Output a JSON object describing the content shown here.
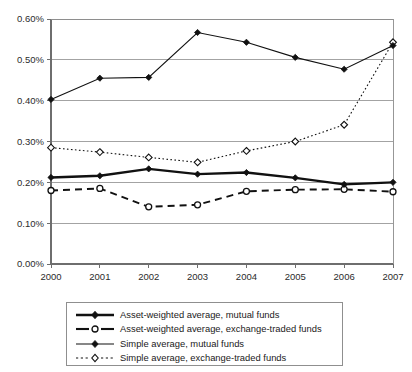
{
  "chart_data": {
    "type": "line",
    "title": "",
    "subtitle": "",
    "xlabel": "",
    "ylabel": "",
    "x": [
      "2000",
      "2001",
      "2002",
      "2003",
      "2004",
      "2005",
      "2006",
      "2007"
    ],
    "xtick_labels": [
      "2000",
      "2001",
      "2002",
      "2003",
      "2004",
      "2005",
      "2006",
      "2007"
    ],
    "ytick_labels": [
      "0.00%",
      "0.10%",
      "0.20%",
      "0.30%",
      "0.40%",
      "0.50%",
      "0.60%"
    ],
    "ytick_values": [
      0.0,
      0.1,
      0.2,
      0.3,
      0.4,
      0.5,
      0.6
    ],
    "ylim": [
      0.0,
      0.6
    ],
    "y_unit": "percent",
    "grid": "horizontal",
    "legend_position": "below",
    "series": [
      {
        "name": "Asset-weighted average, mutual funds",
        "line_style": "solid",
        "line_width": "thick",
        "marker": "filled-diamond",
        "color": "#111111",
        "values": [
          0.212,
          0.216,
          0.233,
          0.22,
          0.224,
          0.211,
          0.195,
          0.2
        ]
      },
      {
        "name": "Asset-weighted average, exchange-traded funds",
        "line_style": "dashed",
        "line_width": "medium",
        "marker": "open-circle",
        "color": "#111111",
        "values": [
          0.18,
          0.185,
          0.14,
          0.145,
          0.178,
          0.182,
          0.183,
          0.177
        ]
      },
      {
        "name": "Simple average, mutual funds",
        "line_style": "solid",
        "line_width": "thin",
        "marker": "filled-diamond",
        "color": "#111111",
        "values": [
          0.403,
          0.455,
          0.457,
          0.567,
          0.543,
          0.506,
          0.477,
          0.535
        ]
      },
      {
        "name": "Simple average, exchange-traded funds",
        "line_style": "dotted",
        "line_width": "thin",
        "marker": "open-diamond",
        "color": "#111111",
        "values": [
          0.285,
          0.274,
          0.261,
          0.249,
          0.277,
          0.3,
          0.341,
          0.543
        ]
      }
    ]
  },
  "legend": {
    "entries": [
      {
        "label": "Asset-weighted average, mutual funds",
        "key": "solid-thick-filled-diamond"
      },
      {
        "label": "Asset-weighted average, exchange-traded funds",
        "key": "dashed-open-circle"
      },
      {
        "label": "Simple average, mutual funds",
        "key": "solid-thin-filled-diamond"
      },
      {
        "label": "Simple average, exchange-traded funds",
        "key": "dotted-open-diamond"
      }
    ]
  },
  "colors": {
    "ink": "#111111",
    "grid": "#8c8c8c",
    "axis": "#6e6e6e",
    "background": "#ffffff"
  }
}
